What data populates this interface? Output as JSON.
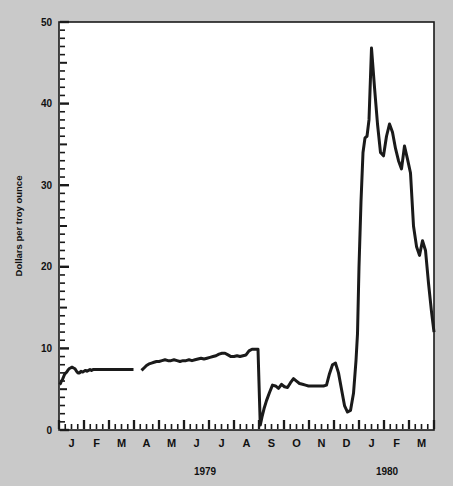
{
  "chart_data": {
    "type": "line",
    "title": "",
    "subtitle": "",
    "xlabel": "",
    "ylabel": "Dollars per troy ounce",
    "ylim": [
      0,
      50
    ],
    "yticks": [
      0,
      10,
      20,
      30,
      40,
      50
    ],
    "ytick_labels": [
      "0",
      "10",
      "20",
      "30",
      "40",
      "50"
    ],
    "y_minor_tick_interval": 1,
    "y_midminor_tick_interval": 5,
    "grid": false,
    "legend": null,
    "legend_position": "none",
    "x_axis_type": "time",
    "x_range": [
      "1979-01-01",
      "1980-04-01"
    ],
    "x_tick_interval": "weekly",
    "x_major_tick_interval": "monthly",
    "month_labels": [
      "J",
      "F",
      "M",
      "A",
      "M",
      "J",
      "J",
      "A",
      "S",
      "O",
      "N",
      "D",
      "J",
      "F",
      "M"
    ],
    "year_labels": [
      "1979",
      "1980"
    ],
    "series_name": "Silver price",
    "line_color": "#1a1a1a",
    "line_width": 3,
    "background_color": "#c9c9c9",
    "plot_background_color": "#ffffff",
    "axis_color": "#1a1a1a",
    "has_data_gap": true,
    "gap_range": [
      "1979-03-28",
      "1979-04-09"
    ],
    "x": [
      0.02,
      0.06,
      0.1,
      0.14,
      0.18,
      0.22,
      0.27,
      0.31,
      0.35,
      0.4,
      0.46,
      0.52,
      0.58,
      0.64,
      0.7,
      0.76,
      0.82,
      0.88,
      0.94,
      1.0,
      1.06,
      1.12,
      1.18,
      1.24,
      1.3,
      1.36,
      1.42,
      1.48,
      1.54,
      1.6,
      1.66,
      1.72,
      1.78,
      1.84,
      1.9,
      1.96,
      2.02,
      2.08,
      2.14,
      2.2,
      2.26,
      2.32,
      2.38,
      2.44,
      2.5,
      2.56,
      2.62,
      2.68,
      2.74,
      2.8,
      2.86,
      2.92,
      2.98,
      3.3,
      3.4,
      3.5,
      3.6,
      3.7,
      3.8,
      3.9,
      4.0,
      4.12,
      4.24,
      4.36,
      4.48,
      4.6,
      4.72,
      4.84,
      4.96,
      5.08,
      5.2,
      5.32,
      5.44,
      5.56,
      5.68,
      5.8,
      5.92,
      6.04,
      6.16,
      6.28,
      6.4,
      6.52,
      6.64,
      6.76,
      6.88,
      7.0,
      7.12,
      7.24,
      7.36,
      7.48,
      7.6,
      7.72,
      7.84,
      7.96,
      8.05,
      8.12,
      8.2,
      8.3,
      8.42,
      8.54,
      8.66,
      8.78,
      8.9,
      9.02,
      9.14,
      9.26,
      9.38,
      9.5,
      9.62,
      9.74,
      9.86,
      9.98,
      10.1,
      10.22,
      10.34,
      10.46,
      10.58,
      10.7,
      10.82,
      10.94,
      11.06,
      11.18,
      11.3,
      11.42,
      11.54,
      11.66,
      11.78,
      11.88,
      11.94,
      12.0,
      12.08,
      12.16,
      12.24,
      12.32,
      12.4,
      12.5,
      12.62,
      12.74,
      12.86,
      12.98,
      13.1,
      13.22,
      13.34,
      13.46,
      13.58,
      13.7,
      13.82,
      13.94,
      14.06,
      14.18,
      14.3,
      14.42,
      14.54,
      14.66,
      14.78,
      14.9,
      15.0
    ],
    "y": [
      5.6,
      5.7,
      6.0,
      6.2,
      6.5,
      6.8,
      7.0,
      7.1,
      7.3,
      7.5,
      7.6,
      7.7,
      7.6,
      7.5,
      7.2,
      7.0,
      7.0,
      7.2,
      7.1,
      7.2,
      7.3,
      7.2,
      7.3,
      7.4,
      7.3,
      7.4,
      7.4,
      7.4,
      7.4,
      7.4,
      7.4,
      7.4,
      7.4,
      7.4,
      7.4,
      7.4,
      7.4,
      7.4,
      7.4,
      7.4,
      7.4,
      7.4,
      7.4,
      7.4,
      7.4,
      7.4,
      7.4,
      7.4,
      7.4,
      7.4,
      7.4,
      7.4,
      7.4,
      7.3,
      7.6,
      7.9,
      8.1,
      8.2,
      8.3,
      8.4,
      8.4,
      8.5,
      8.6,
      8.5,
      8.5,
      8.6,
      8.5,
      8.4,
      8.5,
      8.5,
      8.6,
      8.5,
      8.6,
      8.7,
      8.8,
      8.7,
      8.8,
      8.9,
      9.0,
      9.1,
      9.3,
      9.4,
      9.4,
      9.2,
      9.0,
      9.0,
      9.1,
      9.0,
      9.1,
      9.2,
      9.7,
      9.9,
      9.9,
      9.9,
      0.6,
      1.6,
      2.6,
      3.6,
      4.6,
      5.5,
      5.4,
      5.1,
      5.6,
      5.3,
      5.2,
      5.8,
      6.3,
      6.0,
      5.7,
      5.6,
      5.5,
      5.4,
      5.4,
      5.4,
      5.4,
      5.4,
      5.4,
      5.5,
      6.9,
      8.0,
      8.2,
      7.0,
      5.0,
      3.0,
      2.2,
      2.4,
      4.5,
      8.5,
      11.8,
      20.0,
      28.0,
      34.0,
      35.8,
      36.0,
      38.0,
      46.8,
      42.0,
      37.5,
      34.0,
      33.6,
      36.0,
      37.5,
      36.5,
      34.5,
      33.0,
      32.0,
      34.8,
      33.2,
      31.5,
      25.0,
      22.5,
      21.4,
      23.2,
      22.0,
      18.0,
      14.5,
      12.0
    ]
  },
  "axis": {
    "y_title": "Dollars per troy ounce",
    "y_labels": [
      "50",
      "40",
      "30",
      "20",
      "10",
      "0"
    ],
    "x_month_labels": [
      "J",
      "F",
      "M",
      "A",
      "M",
      "J",
      "J",
      "A",
      "S",
      "O",
      "N",
      "D",
      "J",
      "F",
      "M"
    ],
    "x_year_1": "1979",
    "x_year_2": "1980"
  }
}
